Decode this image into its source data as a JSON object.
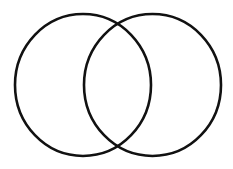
{
  "diagram": {
    "type": "venn",
    "background": "#ffffff",
    "stroke_color": "#111111",
    "stroke_width": 2.6,
    "sets": [
      {
        "name": "left-set",
        "label": "",
        "cx": 83,
        "cy": 85,
        "rx": 68,
        "ry": 71
      },
      {
        "name": "right-set",
        "label": "",
        "cx": 152.5,
        "cy": 85,
        "rx": 68.5,
        "ry": 71
      }
    ]
  }
}
